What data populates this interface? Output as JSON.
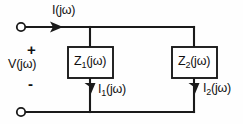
{
  "figure": {
    "name": "parallel-impedance-circuit",
    "background_color": "#fefefe",
    "line_color": "#1a1a1a",
    "width": 243,
    "height": 124
  },
  "labels": {
    "total_current": "I(jω)",
    "source_voltage": "V(jω)",
    "polarity_plus": "+",
    "polarity_minus": "-",
    "impedance_1": "Z₁(jω)",
    "impedance_2": "Z₂(jω)",
    "branch_current_1": "I₁(jω)",
    "branch_current_2": "I₂(jω)"
  },
  "label_parts": {
    "impedance_1": {
      "symbol": "Z",
      "subscript": "1",
      "argument": "(jω)"
    },
    "impedance_2": {
      "symbol": "Z",
      "subscript": "2",
      "argument": "(jω)"
    },
    "branch_current_1": {
      "symbol": "I",
      "subscript": "1",
      "argument": "(jω)"
    },
    "branch_current_2": {
      "symbol": "I",
      "subscript": "2",
      "argument": "(jω)"
    },
    "total_current": {
      "symbol": "I",
      "subscript": "",
      "argument": "(jω)"
    },
    "source_voltage": {
      "symbol": "V",
      "subscript": "",
      "argument": "(jω)"
    }
  },
  "elements": {
    "terminal_top": "open-circle-terminal",
    "terminal_bottom": "open-circle-terminal",
    "current_arrow_total": "right-arrow",
    "current_arrow_1": "down-arrow",
    "current_arrow_2": "down-arrow",
    "box_1": "impedance-box",
    "box_2": "impedance-box"
  }
}
